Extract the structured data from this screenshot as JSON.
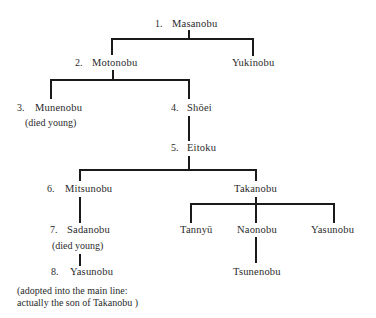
{
  "diagram": {
    "type": "family-tree",
    "nodes": {
      "masanobu": {
        "num": "1.",
        "name": "Masanobu"
      },
      "motonobu": {
        "num": "2.",
        "name": "Motonobu"
      },
      "yukinobu": {
        "name": "Yukinobu"
      },
      "munenobu": {
        "num": "3.",
        "name": "Munenobu",
        "note": "(died young)"
      },
      "shoei": {
        "num": "4.",
        "name": "Shōei"
      },
      "eitoku": {
        "num": "5.",
        "name": "Eitoku"
      },
      "mitsunobu": {
        "num": "6.",
        "name": "Mitsunobu"
      },
      "takanobu": {
        "name": "Takanobu"
      },
      "sadanobu": {
        "num": "7.",
        "name": "Sadanobu",
        "note": "(died young)"
      },
      "yasunobu_main": {
        "num": "8.",
        "name": "Yasunobu",
        "note_line1": "(adopted into the main line:",
        "note_line2": "actually the son of  Takanobu )"
      },
      "tannyu": {
        "name": "Tannyū"
      },
      "naonobu": {
        "name": "Naonobu"
      },
      "yasunobu": {
        "name": "Yasunobu"
      },
      "tsunenobu": {
        "name": "Tsunenobu"
      }
    },
    "edges": [
      [
        "masanobu",
        "motonobu"
      ],
      [
        "masanobu",
        "yukinobu"
      ],
      [
        "motonobu",
        "munenobu"
      ],
      [
        "motonobu",
        "shoei"
      ],
      [
        "shoei",
        "eitoku"
      ],
      [
        "eitoku",
        "mitsunobu"
      ],
      [
        "eitoku",
        "takanobu"
      ],
      [
        "mitsunobu",
        "sadanobu"
      ],
      [
        "sadanobu",
        "yasunobu_main"
      ],
      [
        "takanobu",
        "tannyu"
      ],
      [
        "takanobu",
        "naonobu"
      ],
      [
        "takanobu",
        "yasunobu"
      ],
      [
        "naonobu",
        "tsunenobu"
      ]
    ]
  }
}
